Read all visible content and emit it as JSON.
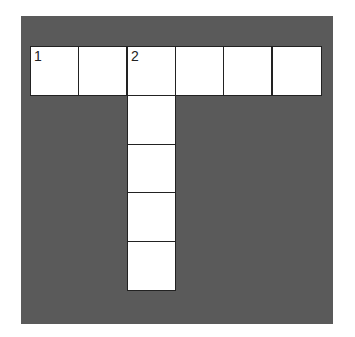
{
  "puzzle": {
    "type": "crossword",
    "board_color": "#5a5a5a",
    "cell_color": "#ffffff",
    "across": {
      "clue_number": "1",
      "length": 6,
      "cells": [
        {
          "number": "1"
        },
        {
          "number": ""
        },
        {
          "number": "2"
        },
        {
          "number": ""
        },
        {
          "number": ""
        },
        {
          "number": ""
        }
      ]
    },
    "down": {
      "clue_number": "2",
      "length": 5,
      "start_column": 3
    }
  }
}
